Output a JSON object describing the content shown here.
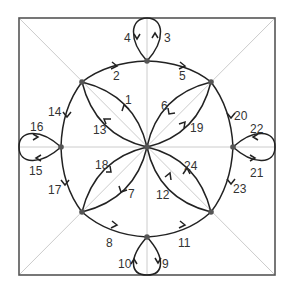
{
  "diagram": {
    "type": "directed-multigraph",
    "colors": {
      "frame": "#555555",
      "guide": "#cccccc",
      "edge": "#222222",
      "node": "#555555",
      "label": "#333333"
    },
    "nodes": [
      {
        "id": "C",
        "x": 147,
        "y": 147
      },
      {
        "id": "T",
        "x": 147,
        "y": 61
      },
      {
        "id": "B",
        "x": 147,
        "y": 237
      },
      {
        "id": "L",
        "x": 61,
        "y": 147
      },
      {
        "id": "R",
        "x": 233,
        "y": 147
      },
      {
        "id": "TL",
        "x": 82,
        "y": 82
      },
      {
        "id": "TR",
        "x": 211,
        "y": 82
      },
      {
        "id": "BL",
        "x": 82,
        "y": 212
      },
      {
        "id": "BR",
        "x": 211,
        "y": 212
      }
    ],
    "edge_labels": {
      "e1": "1",
      "e2": "2",
      "e3": "3",
      "e4": "4",
      "e5": "5",
      "e6": "6",
      "e7": "7",
      "e8": "8",
      "e9": "9",
      "e10": "10",
      "e11": "11",
      "e12": "12",
      "e13": "13",
      "e14": "14",
      "e15": "15",
      "e16": "16",
      "e17": "17",
      "e18": "18",
      "e19": "19",
      "e20": "20",
      "e21": "21",
      "e22": "22",
      "e23": "23",
      "e24": "24"
    },
    "edges": [
      {
        "label": "1",
        "from": "C",
        "to": "TL"
      },
      {
        "label": "13",
        "from": "C",
        "to": "TL"
      },
      {
        "label": "2",
        "from": "TL",
        "to": "T"
      },
      {
        "label": "3",
        "from": "T",
        "to": "T",
        "loop": true
      },
      {
        "label": "4",
        "from": "T",
        "to": "T",
        "loop": true
      },
      {
        "label": "5",
        "from": "T",
        "to": "TR"
      },
      {
        "label": "6",
        "from": "TR",
        "to": "C"
      },
      {
        "label": "19",
        "from": "C",
        "to": "TR"
      },
      {
        "label": "20",
        "from": "TR",
        "to": "R"
      },
      {
        "label": "21",
        "from": "R",
        "to": "R",
        "loop": true
      },
      {
        "label": "22",
        "from": "R",
        "to": "R",
        "loop": true
      },
      {
        "label": "23",
        "from": "R",
        "to": "BR"
      },
      {
        "label": "12",
        "from": "BR",
        "to": "C"
      },
      {
        "label": "24",
        "from": "BR",
        "to": "C"
      },
      {
        "label": "11",
        "from": "B",
        "to": "BR"
      },
      {
        "label": "9",
        "from": "B",
        "to": "B",
        "loop": true
      },
      {
        "label": "10",
        "from": "B",
        "to": "B",
        "loop": true
      },
      {
        "label": "8",
        "from": "BL",
        "to": "B"
      },
      {
        "label": "7",
        "from": "C",
        "to": "BL"
      },
      {
        "label": "18",
        "from": "BL",
        "to": "C"
      },
      {
        "label": "17",
        "from": "L",
        "to": "BL"
      },
      {
        "label": "15",
        "from": "L",
        "to": "L",
        "loop": true
      },
      {
        "label": "16",
        "from": "L",
        "to": "L",
        "loop": true
      },
      {
        "label": "14",
        "from": "TL",
        "to": "L"
      }
    ]
  }
}
